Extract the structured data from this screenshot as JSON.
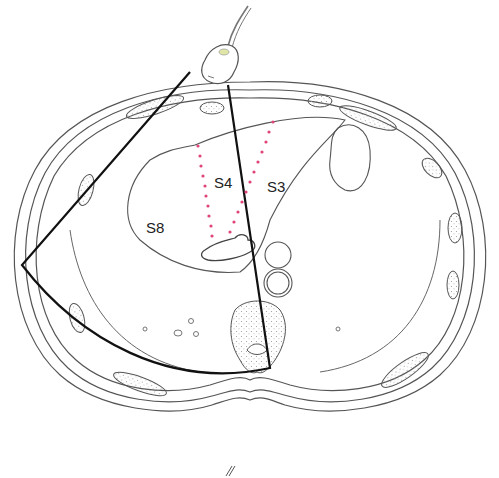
{
  "figure": {
    "segment_labels": [
      {
        "id": "S4",
        "text": "S4",
        "x": 214,
        "y": 174
      },
      {
        "id": "S3",
        "text": "S3",
        "x": 267,
        "y": 178
      },
      {
        "id": "S8",
        "text": "S8",
        "x": 146,
        "y": 219
      }
    ],
    "colors": {
      "outline": "#555555",
      "sector": "#111111",
      "dotted_boundary": "#e0457a",
      "bone_stipple": "#aaaaaa"
    },
    "elements": {
      "probe": "ultrasound-probe",
      "sector": "scan-sector",
      "boundaries": [
        "falciform-boundary-left",
        "falciform-boundary-right"
      ]
    }
  }
}
